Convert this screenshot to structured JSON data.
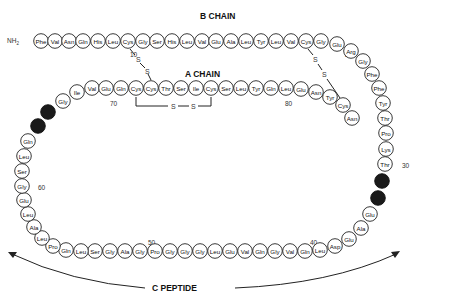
{
  "labels": {
    "b_chain": "B CHAIN",
    "a_chain": "A CHAIN",
    "c_peptide": "C PEPTIDE",
    "nh2": "NH2",
    "disulfide_s": "S"
  },
  "position_numbers": [
    {
      "text": "10",
      "x": 130,
      "y": 57
    },
    {
      "text": "20",
      "x": 345,
      "y": 57
    },
    {
      "text": "30",
      "x": 402,
      "y": 168
    },
    {
      "text": "40",
      "x": 310,
      "y": 245
    },
    {
      "text": "50",
      "x": 148,
      "y": 245
    },
    {
      "text": "60",
      "x": 38,
      "y": 190
    },
    {
      "text": "70",
      "x": 110,
      "y": 106
    },
    {
      "text": "80",
      "x": 285,
      "y": 106
    }
  ],
  "b_chain": [
    {
      "aa": "Phe",
      "x": 41,
      "y": 41
    },
    {
      "aa": "Val",
      "x": 55,
      "y": 41
    },
    {
      "aa": "Asn",
      "x": 69,
      "y": 41
    },
    {
      "aa": "Gln",
      "x": 83,
      "y": 41
    },
    {
      "aa": "His",
      "x": 98,
      "y": 41
    },
    {
      "aa": "Leu",
      "x": 113,
      "y": 41
    },
    {
      "aa": "Cys",
      "x": 128,
      "y": 41
    },
    {
      "aa": "Gly",
      "x": 143,
      "y": 41
    },
    {
      "aa": "Ser",
      "x": 157,
      "y": 41
    },
    {
      "aa": "His",
      "x": 172,
      "y": 41
    },
    {
      "aa": "Leu",
      "x": 187,
      "y": 41
    },
    {
      "aa": "Val",
      "x": 202,
      "y": 41
    },
    {
      "aa": "Glu",
      "x": 216,
      "y": 41
    },
    {
      "aa": "Ala",
      "x": 231,
      "y": 41
    },
    {
      "aa": "Leu",
      "x": 246,
      "y": 41
    },
    {
      "aa": "Tyr",
      "x": 261,
      "y": 41
    },
    {
      "aa": "Leu",
      "x": 276,
      "y": 41
    },
    {
      "aa": "Val",
      "x": 291,
      "y": 41
    },
    {
      "aa": "Cys",
      "x": 306,
      "y": 41
    },
    {
      "aa": "Gly",
      "x": 321,
      "y": 41
    },
    {
      "aa": "Glu",
      "x": 337,
      "y": 44
    },
    {
      "aa": "Arg",
      "x": 351,
      "y": 51
    },
    {
      "aa": "Gly",
      "x": 363,
      "y": 61
    },
    {
      "aa": "Phe",
      "x": 372,
      "y": 74
    },
    {
      "aa": "Phe",
      "x": 379,
      "y": 88
    },
    {
      "aa": "Tyr",
      "x": 383,
      "y": 103
    },
    {
      "aa": "Thr",
      "x": 385,
      "y": 118
    },
    {
      "aa": "Pro",
      "x": 386,
      "y": 133
    },
    {
      "aa": "Lys",
      "x": 386,
      "y": 149
    },
    {
      "aa": "Thr",
      "x": 385,
      "y": 164
    }
  ],
  "c_peptide": [
    {
      "aa": "Arg",
      "x": 382,
      "y": 181,
      "dark": true
    },
    {
      "aa": "Arg",
      "x": 378,
      "y": 198,
      "dark": true
    },
    {
      "aa": "Glu",
      "x": 370,
      "y": 214
    },
    {
      "aa": "Ala",
      "x": 361,
      "y": 228
    },
    {
      "aa": "Glu",
      "x": 349,
      "y": 239
    },
    {
      "aa": "Asp",
      "x": 335,
      "y": 246
    },
    {
      "aa": "Leu",
      "x": 320,
      "y": 250
    },
    {
      "aa": "Gln",
      "x": 305,
      "y": 251
    },
    {
      "aa": "Val",
      "x": 290,
      "y": 251
    },
    {
      "aa": "Gly",
      "x": 275,
      "y": 251
    },
    {
      "aa": "Gln",
      "x": 260,
      "y": 251
    },
    {
      "aa": "Val",
      "x": 245,
      "y": 251
    },
    {
      "aa": "Glu",
      "x": 230,
      "y": 251
    },
    {
      "aa": "Leu",
      "x": 215,
      "y": 251
    },
    {
      "aa": "Gly",
      "x": 200,
      "y": 251
    },
    {
      "aa": "Gly",
      "x": 185,
      "y": 251
    },
    {
      "aa": "Gly",
      "x": 170,
      "y": 251
    },
    {
      "aa": "Pro",
      "x": 155,
      "y": 251
    },
    {
      "aa": "Gly",
      "x": 140,
      "y": 251
    },
    {
      "aa": "Ala",
      "x": 125,
      "y": 251
    },
    {
      "aa": "Gly",
      "x": 110,
      "y": 251
    },
    {
      "aa": "Ser",
      "x": 95,
      "y": 251
    },
    {
      "aa": "Leu",
      "x": 81,
      "y": 251
    },
    {
      "aa": "Gln",
      "x": 66,
      "y": 250
    },
    {
      "aa": "Pro",
      "x": 53,
      "y": 246
    },
    {
      "aa": "Leu",
      "x": 42,
      "y": 238
    },
    {
      "aa": "Ala",
      "x": 34,
      "y": 227
    },
    {
      "aa": "Leu",
      "x": 28,
      "y": 214
    },
    {
      "aa": "Glu",
      "x": 24,
      "y": 200
    },
    {
      "aa": "Gly",
      "x": 22,
      "y": 186
    },
    {
      "aa": "Ser",
      "x": 22,
      "y": 171
    },
    {
      "aa": "Leu",
      "x": 24,
      "y": 156
    },
    {
      "aa": "Gln",
      "x": 28,
      "y": 141
    },
    {
      "aa": "Lys",
      "x": 38,
      "y": 126,
      "dark": true
    },
    {
      "aa": "Arg",
      "x": 48,
      "y": 112,
      "dark": true
    }
  ],
  "a_chain": [
    {
      "aa": "Gly",
      "x": 63,
      "y": 101
    },
    {
      "aa": "Ile",
      "x": 77,
      "y": 92
    },
    {
      "aa": "Val",
      "x": 92,
      "y": 88
    },
    {
      "aa": "Glu",
      "x": 106,
      "y": 88
    },
    {
      "aa": "Gln",
      "x": 121,
      "y": 88
    },
    {
      "aa": "Cys",
      "x": 136,
      "y": 88
    },
    {
      "aa": "Cys",
      "x": 151,
      "y": 88
    },
    {
      "aa": "Thr",
      "x": 166,
      "y": 88
    },
    {
      "aa": "Ser",
      "x": 181,
      "y": 88
    },
    {
      "aa": "Ile",
      "x": 196,
      "y": 88
    },
    {
      "aa": "Cys",
      "x": 211,
      "y": 88
    },
    {
      "aa": "Ser",
      "x": 226,
      "y": 88
    },
    {
      "aa": "Leu",
      "x": 241,
      "y": 88
    },
    {
      "aa": "Tyr",
      "x": 256,
      "y": 88
    },
    {
      "aa": "Gln",
      "x": 271,
      "y": 88
    },
    {
      "aa": "Leu",
      "x": 286,
      "y": 88
    },
    {
      "aa": "Glu",
      "x": 301,
      "y": 89
    },
    {
      "aa": "Asn",
      "x": 316,
      "y": 92
    },
    {
      "aa": "Tyr",
      "x": 330,
      "y": 97
    },
    {
      "aa": "Cys",
      "x": 343,
      "y": 105
    },
    {
      "aa": "Asn",
      "x": 352,
      "y": 118
    }
  ]
}
